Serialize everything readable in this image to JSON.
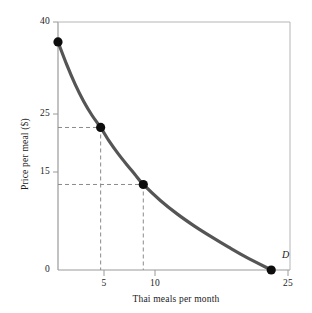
{
  "chart_data": {
    "type": "line",
    "title": "",
    "subtitle": "",
    "xlabel": "Thai meals per month",
    "ylabel": "Price per meal ($)",
    "xlim": [
      0,
      27.2
    ],
    "ylim": [
      0,
      43.5
    ],
    "grid": false,
    "legend_position": "none",
    "curve_label": "D",
    "series": [
      {
        "name": "D",
        "label": "D",
        "color": "#555555",
        "x": [
          0,
          1,
          2,
          3,
          4,
          5,
          6,
          7,
          8,
          9,
          10,
          12,
          14,
          16,
          18,
          20,
          22,
          25
        ],
        "y": [
          40,
          36.1,
          32.6,
          29.6,
          27.1,
          25,
          22.6,
          20.5,
          18.6,
          16.8,
          15,
          12.2,
          9.8,
          7.7,
          5.8,
          4.0,
          2.3,
          0
        ]
      }
    ],
    "markers": [
      {
        "x": 0,
        "y": 40
      },
      {
        "x": 5,
        "y": 25
      },
      {
        "x": 10,
        "y": 15
      },
      {
        "x": 25,
        "y": 0
      }
    ],
    "guide_lines": [
      {
        "x": 5,
        "y": 25
      },
      {
        "x": 10,
        "y": 15
      }
    ],
    "x_ticks": [
      {
        "value": 5,
        "label": "5"
      },
      {
        "value": 10,
        "label": "10"
      },
      {
        "value": 25,
        "label": "25"
      }
    ],
    "y_ticks": [
      {
        "value": 40,
        "label": "40"
      },
      {
        "value": 25,
        "label": "25"
      },
      {
        "value": 15,
        "label": "15"
      },
      {
        "value": 0,
        "label": "0"
      }
    ],
    "colors": {
      "curve": "#555555",
      "marker": "#0d0d0d",
      "axis": "#9a9a9a",
      "guide": "#8a8a8a",
      "text": "#1a1a1a",
      "background": "#ffffff"
    }
  }
}
